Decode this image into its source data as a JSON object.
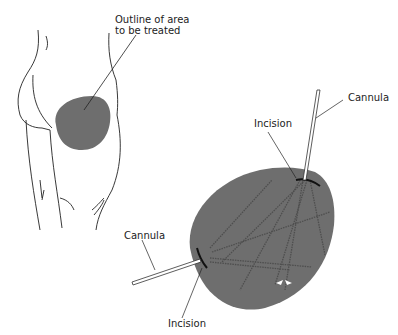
{
  "labels": {
    "outline_line1": "Outline of area",
    "outline_line2": "to be treated",
    "cannula_top": "Cannula",
    "incision_top": "Incision",
    "cannula_left": "Cannula",
    "incision_bottom": "Incision"
  },
  "colors": {
    "fill": "#6e6e6e",
    "stroke": "#222222",
    "tunnel": "#555555",
    "cannula": "#ffffff"
  }
}
